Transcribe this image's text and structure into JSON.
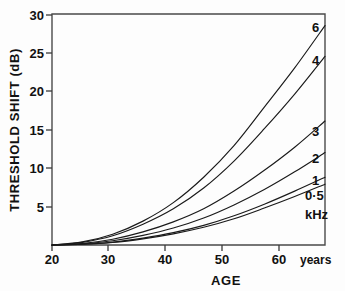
{
  "chart_data": {
    "type": "line",
    "title": "",
    "xlabel": "AGE",
    "ylabel": "THRESHOLD SHIFT (dB)",
    "x_unit": "years",
    "series_unit": "kHz",
    "xlim": [
      20,
      65
    ],
    "ylim": [
      0,
      30
    ],
    "xticks": [
      20,
      30,
      40,
      50,
      60
    ],
    "yticks": [
      0,
      5,
      10,
      15,
      20,
      25,
      30
    ],
    "xtick_labels": [
      "20",
      "30",
      "40",
      "50",
      "60"
    ],
    "ytick_labels": [
      "5",
      "10",
      "15",
      "20",
      "25",
      "30"
    ],
    "grid": false,
    "legend_position": "right-inline-labels",
    "x": [
      20,
      25,
      30,
      35,
      40,
      45,
      50,
      55,
      60,
      65
    ],
    "series": [
      {
        "name": "6",
        "label": "6",
        "values": [
          0,
          0.4,
          1.4,
          3.1,
          5.5,
          8.8,
          12.9,
          17.9,
          23.0,
          28.5
        ]
      },
      {
        "name": "4",
        "label": "4",
        "values": [
          0,
          0.35,
          1.2,
          2.7,
          4.7,
          7.4,
          10.9,
          15.1,
          19.6,
          24.5
        ]
      },
      {
        "name": "3",
        "label": "3",
        "values": [
          0,
          0.2,
          0.75,
          1.7,
          3.0,
          4.7,
          7.0,
          9.7,
          12.7,
          16.1
        ]
      },
      {
        "name": "2",
        "label": "2",
        "values": [
          0,
          0.15,
          0.55,
          1.25,
          2.2,
          3.5,
          5.2,
          7.2,
          9.5,
          12.0
        ]
      },
      {
        "name": "1",
        "label": "1",
        "values": [
          0,
          0.1,
          0.38,
          0.9,
          1.6,
          2.55,
          3.8,
          5.3,
          7.0,
          8.8
        ]
      },
      {
        "name": "0.5",
        "label": "0·5",
        "values": [
          0,
          0.1,
          0.33,
          0.8,
          1.45,
          2.3,
          3.4,
          4.8,
          6.3,
          7.9
        ]
      }
    ],
    "series_labels_order": [
      "6",
      "4",
      "3",
      "2",
      "1",
      "0·5"
    ],
    "annotations": [
      "years",
      "kHz"
    ],
    "colors": {
      "curve": "#1a1a1a",
      "axis": "#4a4a4a",
      "text": "#111111",
      "background": "#fdfdfd"
    }
  },
  "axes": {
    "y_title": "THRESHOLD SHIFT (dB)",
    "x_title": "AGE",
    "x_unit_label": "years",
    "series_unit_label": "kHz"
  },
  "ticks": {
    "x": [
      {
        "value": "20",
        "px": 52
      },
      {
        "value": "30",
        "px": 108
      },
      {
        "value": "40",
        "px": 165
      },
      {
        "value": "50",
        "px": 222
      },
      {
        "value": "60",
        "px": 279
      }
    ],
    "y": [
      {
        "value": "5",
        "px": 207
      },
      {
        "value": "10",
        "px": 168
      },
      {
        "value": "15",
        "px": 130
      },
      {
        "value": "20",
        "px": 91
      },
      {
        "value": "25",
        "px": 53
      },
      {
        "value": "30",
        "px": 15
      }
    ]
  },
  "series_label_positions": [
    {
      "label": "6",
      "x": 312,
      "y": 32
    },
    {
      "label": "4",
      "x": 312,
      "y": 65
    },
    {
      "label": "3",
      "x": 312,
      "y": 136
    },
    {
      "label": "2",
      "x": 312,
      "y": 163
    },
    {
      "label": "1",
      "x": 312,
      "y": 185
    },
    {
      "label": "0·5",
      "x": 305,
      "y": 200
    },
    {
      "label": "kHz",
      "x": 305,
      "y": 218
    }
  ]
}
